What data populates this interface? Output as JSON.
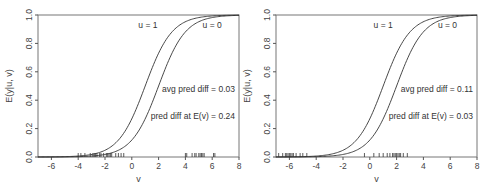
{
  "chart_data": [
    {
      "type": "line",
      "panel": "left",
      "title": "",
      "xlabel": "v",
      "ylabel": "E(y|u, v)",
      "xlim": [
        -7,
        8
      ],
      "ylim": [
        0,
        1
      ],
      "x_ticks": [
        -6,
        -4,
        -2,
        0,
        2,
        4,
        6,
        8
      ],
      "x_tick_labels": [
        "-6",
        "-4",
        "-2",
        "0",
        "2",
        "4",
        "6",
        "8"
      ],
      "y_ticks": [
        0,
        0.2,
        0.4,
        0.6,
        0.8,
        1.0
      ],
      "y_tick_labels": [
        "0.0",
        "0.2",
        "0.4",
        "0.6",
        "0.8",
        "1.0"
      ],
      "grid": false,
      "series": [
        {
          "name": "u = 1",
          "curve": "logistic",
          "midpoint": 1.0,
          "scale": 1.0,
          "label_at": [
            1.2,
            0.93
          ]
        },
        {
          "name": "u = 0",
          "curve": "logistic",
          "midpoint": 2.0,
          "scale": 1.0,
          "label_at": [
            6.0,
            0.93
          ]
        }
      ],
      "rug": [
        -4.0,
        -3.8,
        -3.5,
        -3.1,
        -2.9,
        -2.8,
        -2.7,
        -2.6,
        -2.4,
        -2.3,
        -2.1,
        -1.9,
        -1.8,
        -1.7,
        -1.6,
        -1.5,
        -1.2,
        -1.0,
        -0.8,
        -0.6,
        4.0,
        4.1,
        4.5,
        4.7,
        4.8,
        5.0,
        5.1,
        5.2,
        5.3,
        5.4,
        6.1,
        6.2
      ],
      "annotations": [
        {
          "text": "avg pred diff = 0.03",
          "x": 7.7,
          "y": 0.46,
          "anchor": "end"
        },
        {
          "text": "pred diff at E(v) = 0.24",
          "x": 7.7,
          "y": 0.27,
          "anchor": "end"
        }
      ]
    },
    {
      "type": "line",
      "panel": "right",
      "title": "",
      "xlabel": "v",
      "ylabel": "E(y|u, v)",
      "xlim": [
        -7,
        8
      ],
      "ylim": [
        0,
        1
      ],
      "x_ticks": [
        -6,
        -4,
        -2,
        0,
        2,
        4,
        6,
        8
      ],
      "x_tick_labels": [
        "-6",
        "-4",
        "-2",
        "0",
        "2",
        "4",
        "6",
        "8"
      ],
      "y_ticks": [
        0,
        0.2,
        0.4,
        0.6,
        0.8,
        1.0
      ],
      "y_tick_labels": [
        "0.0",
        "0.2",
        "0.4",
        "0.6",
        "0.8",
        "1.0"
      ],
      "grid": false,
      "series": [
        {
          "name": "u = 1",
          "curve": "logistic",
          "midpoint": 1.0,
          "scale": 1.0,
          "label_at": [
            1.0,
            0.93
          ]
        },
        {
          "name": "u = 0",
          "curve": "logistic",
          "midpoint": 2.0,
          "scale": 1.0,
          "label_at": [
            5.8,
            0.93
          ]
        }
      ],
      "rug": [
        -6.8,
        -6.5,
        -6.3,
        -6.2,
        -6.1,
        -6.0,
        -5.9,
        -5.8,
        -5.7,
        -5.5,
        -5.2,
        -5.0,
        -4.7,
        -0.4,
        0.3,
        0.7,
        1.0,
        1.3,
        1.5,
        1.7,
        1.8,
        1.9,
        2.0,
        2.1,
        2.2,
        2.3,
        2.5,
        2.8
      ],
      "annotations": [
        {
          "text": "avg pred diff = 0.11",
          "x": 7.7,
          "y": 0.46,
          "anchor": "end"
        },
        {
          "text": "pred diff at E(v) = 0.03",
          "x": 7.7,
          "y": 0.27,
          "anchor": "end"
        }
      ]
    }
  ]
}
